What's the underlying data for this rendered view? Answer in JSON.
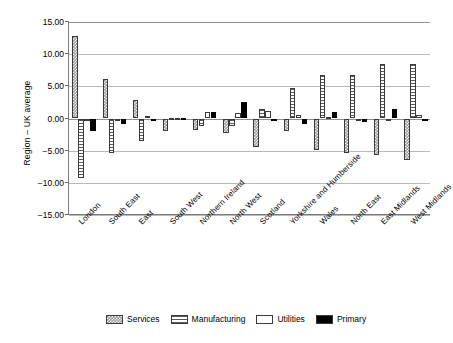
{
  "chart": {
    "type": "bar",
    "ylabel": "Region – UK average",
    "xlabel": ""
  },
  "legend": {
    "items": [
      {
        "label": "Services",
        "key": "services"
      },
      {
        "label": "Manufacturing",
        "key": "manufacturing"
      },
      {
        "label": "Utilities",
        "key": "utilities"
      },
      {
        "label": "Primary",
        "key": "primary"
      }
    ]
  },
  "yaxis": {
    "ticks": [
      {
        "label": "15.00",
        "value": 15
      },
      {
        "label": "10.00",
        "value": 10
      },
      {
        "label": "5.00",
        "value": 5
      },
      {
        "label": "0.00",
        "value": 0
      },
      {
        "label": "−5.00",
        "value": -5
      },
      {
        "label": "−10.00",
        "value": -10
      },
      {
        "label": "−15.00",
        "value": -15
      }
    ]
  },
  "chart_data": {
    "type": "bar",
    "title": "",
    "xlabel": "",
    "ylabel": "Region – UK average",
    "ylim": [
      -15,
      15
    ],
    "grid": true,
    "legend_position": "bottom",
    "categories": [
      "London",
      "South East",
      "East",
      "South West",
      "Northern Ireland",
      "North West",
      "Scotland",
      "Yorkshire and Humberside",
      "Wales",
      "North East",
      "East Midlands",
      "West Midlands"
    ],
    "series": [
      {
        "name": "Services",
        "values": [
          12.9,
          6.2,
          2.8,
          -1.9,
          -1.8,
          -2.3,
          -4.5,
          -2.0,
          -4.9,
          -5.3,
          -5.6,
          -6.4
        ]
      },
      {
        "name": "Manufacturing",
        "values": [
          -9.2,
          -5.3,
          -3.5,
          0.1,
          -1.1,
          -1.1,
          1.5,
          4.7,
          6.8,
          6.8,
          8.4,
          8.5
        ]
      },
      {
        "name": "Utilities",
        "values": [
          -0.3,
          -0.1,
          0.4,
          0.1,
          1.0,
          0.8,
          1.1,
          0.5,
          0.2,
          -0.3,
          -0.2,
          0.5
        ]
      },
      {
        "name": "Primary",
        "values": [
          -2.0,
          -0.9,
          -0.1,
          0.1,
          1.0,
          2.5,
          -0.2,
          -0.9,
          1.0,
          -0.5,
          1.5,
          -0.1
        ]
      }
    ]
  }
}
